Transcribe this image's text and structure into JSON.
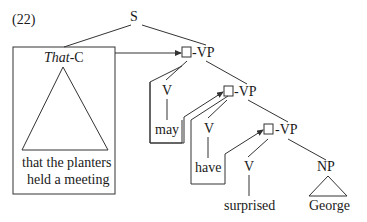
{
  "example_number": "(22)",
  "root": "S",
  "subject": {
    "label_italic": "That",
    "label_rest": "-C",
    "text_line1": "that the planters",
    "text_line2": "held a meeting"
  },
  "vp_nodes": [
    {
      "label": "-VP",
      "head_cat": "V",
      "head_word": "may"
    },
    {
      "label": "-VP",
      "head_cat": "V",
      "head_word": "have"
    },
    {
      "label": "-VP",
      "head_cat": "V",
      "head_word": "surprised"
    }
  ],
  "object": {
    "cat": "NP",
    "word": "George"
  },
  "colors": {
    "ink": "#1a1a1a",
    "line": "#333333",
    "background": "#ffffff"
  }
}
